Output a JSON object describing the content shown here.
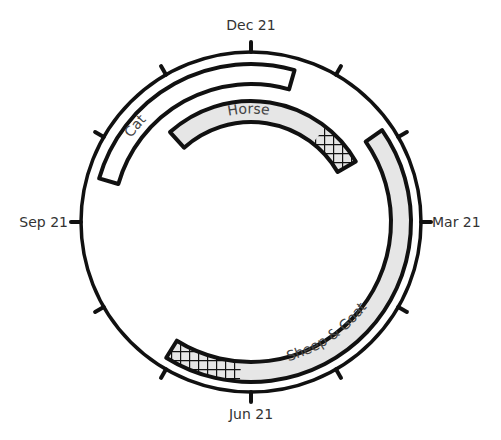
{
  "diagram": {
    "type": "circular-calendar",
    "center": [
      251,
      222
    ],
    "outer_radius": 170,
    "month_labels": [
      {
        "label": "Dec 21",
        "angle": 0
      },
      {
        "label": "Mar 21",
        "angle": 90
      },
      {
        "label": "Jun 21",
        "angle": 180
      },
      {
        "label": "Sep 21",
        "angle": 270
      }
    ],
    "tick_count": 12,
    "bars": [
      {
        "label": "Cat",
        "start_angle": 286,
        "end_angle": 16,
        "r_inner": 138,
        "r_outer": 158,
        "fill": "#ffffff",
        "hatch": null
      },
      {
        "label": "Horse",
        "start_angle": 318,
        "end_angle": 60,
        "r_inner": 100,
        "r_outer": 121,
        "fill": "#e6e6e6",
        "hatch": {
          "start_angle": 38,
          "end_angle": 60
        }
      },
      {
        "label": "Sheep & Goat",
        "start_angle": 55,
        "end_angle": 212,
        "r_inner": 140,
        "r_outer": 160,
        "fill": "#e6e6e6",
        "hatch": {
          "start_angle": 184,
          "end_angle": 212
        }
      }
    ]
  },
  "colors": {
    "stroke": "#111111",
    "fill_gray": "#e6e6e6",
    "text": "#333333"
  }
}
